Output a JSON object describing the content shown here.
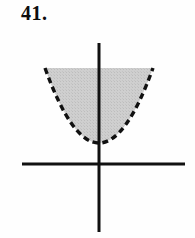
{
  "figure": {
    "problem_number": "41.",
    "background_color": "#fefefe"
  },
  "chart_data": {
    "type": "line",
    "title": "41.",
    "xlabel": "",
    "ylabel": "",
    "grid": false,
    "legend": null,
    "annotations": [],
    "axes": {
      "x_axis": {
        "name": "x-axis",
        "orientation": "horizontal",
        "color": "#111111",
        "style": "solid",
        "thickness_px": 3,
        "pixel_y": 164,
        "pixel_x_start": 22,
        "pixel_x_end": 185
      },
      "y_axis": {
        "name": "y-axis",
        "orientation": "vertical",
        "color": "#111111",
        "style": "solid",
        "thickness_px": 3,
        "pixel_x": 99,
        "pixel_y_start": 43,
        "pixel_y_end": 232
      },
      "origin_pixel": {
        "x": 99,
        "y": 164
      },
      "tick_labels_x": [],
      "tick_labels_y": []
    },
    "curves": [
      {
        "name": "parabola-boundary",
        "shape": "parabola",
        "opens": "up",
        "line_style": "dashed",
        "line_color": "#111111",
        "line_width_px": 3.4,
        "dash_pattern": "6 4",
        "boundary_included": false,
        "vertex_pixel": {
          "x": 99,
          "y": 143
        },
        "left_endpoint_pixel": {
          "x": 45,
          "y": 68
        },
        "right_endpoint_pixel": {
          "x": 153,
          "y": 68
        },
        "path": "M 45 68 Q 99 218 153 68"
      }
    ],
    "shaded_regions": [
      {
        "name": "parabola-interior-shading",
        "description": "interior of the upward-opening parabola, above the vertex",
        "fill_color": "#c9c9c9",
        "fill_style": "halftone-gray",
        "top_edge_pixel_y": 68,
        "top_edge_open": true,
        "path": "M 45 68 Q 99 218 153 68 Z"
      }
    ]
  }
}
